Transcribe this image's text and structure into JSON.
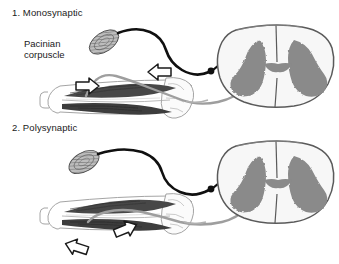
{
  "figure": {
    "width": 339,
    "height": 264,
    "background": "#ffffff"
  },
  "colors": {
    "background": "#ffffff",
    "text": "#1a1a1a",
    "afferent_nerve": "#111111",
    "efferent_nerve": "#9a9a9a",
    "grey_matter": "#8a8a8a",
    "white_matter": "#f4f4f4",
    "cord_outline": "#4a4a4a",
    "muscle_dark": "#4a4a4a",
    "muscle_mid": "#6e6e6e",
    "bone_outline": "#8d8d8d",
    "corpuscle_fill": "#b5b5b5",
    "corpuscle_outline": "#5a5a5a",
    "arrow_fill": "#ffffff",
    "arrow_stroke": "#1a1a1a"
  },
  "panels": [
    {
      "id": "monosynaptic",
      "number": "1.",
      "title": "1. Monosynaptic",
      "labels": [
        {
          "name": "pacinian-corpuscle-label",
          "line1": "Pacinian",
          "line2": "corpuscle"
        }
      ],
      "arrows": [
        {
          "name": "arrow-stretch-left",
          "direction": "right"
        },
        {
          "name": "arrow-stretch-right",
          "direction": "left"
        }
      ],
      "structures": [
        "pacinian-corpuscle",
        "afferent-nerve-fiber",
        "efferent-nerve-fiber",
        "dorsal-root-ganglion",
        "spinal-cord-cross-section",
        "grey-matter",
        "arm-limb",
        "biceps-muscle",
        "triceps-muscle",
        "humerus-bone",
        "ulna-bone"
      ]
    },
    {
      "id": "polysynaptic",
      "number": "2.",
      "title": "2. Polysynaptic",
      "labels": [],
      "arrows": [
        {
          "name": "arrow-stretch-left",
          "direction": "left"
        },
        {
          "name": "arrow-stretch-right",
          "direction": "right"
        }
      ],
      "structures": [
        "pacinian-corpuscle",
        "afferent-nerve-fiber",
        "efferent-nerve-fiber",
        "dorsal-root-ganglion",
        "interneuron",
        "spinal-cord-cross-section",
        "grey-matter",
        "arm-limb",
        "biceps-muscle",
        "triceps-muscle",
        "humerus-bone",
        "ulna-bone"
      ]
    }
  ]
}
